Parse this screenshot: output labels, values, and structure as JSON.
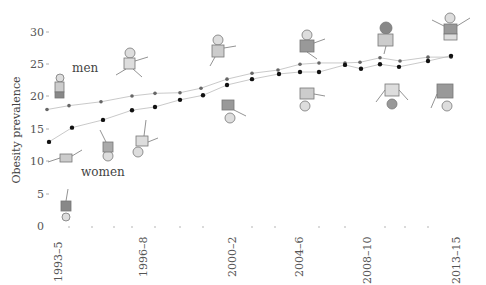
{
  "chart_data": {
    "type": "line",
    "title": "",
    "xlabel": "",
    "ylabel": "Obesity prevalence",
    "ylim": [
      0,
      30
    ],
    "yticks": [
      0,
      5,
      10,
      15,
      20,
      25,
      30
    ],
    "xtick_labels": [
      "1993–5",
      "1996–8",
      "2000–2",
      "2004–6",
      "2008–10",
      "2013–15"
    ],
    "grid": false,
    "legend": "inline labels",
    "series": [
      {
        "name": "men",
        "x_px": [
          47,
          69,
          101,
          132,
          155,
          180,
          201,
          227,
          252,
          278,
          300,
          319,
          345,
          360,
          380,
          400,
          428,
          451
        ],
        "values": [
          18.0,
          18.6,
          19.2,
          20.1,
          20.5,
          20.6,
          21.3,
          22.7,
          23.6,
          24.1,
          25.0,
          25.2,
          25.2,
          25.3,
          26.0,
          25.5,
          26.1,
          26.1
        ]
      },
      {
        "name": "women",
        "x_px": [
          49,
          72,
          103,
          132,
          155,
          180,
          203,
          227,
          252,
          279,
          300,
          319,
          345,
          361,
          380,
          399,
          428,
          451
        ],
        "values": [
          13.0,
          15.2,
          16.4,
          17.9,
          18.4,
          19.5,
          20.2,
          21.8,
          22.7,
          23.5,
          23.8,
          23.8,
          24.9,
          24.3,
          25.0,
          24.6,
          25.5,
          26.3
        ]
      }
    ],
    "annotations": [
      "men",
      "women"
    ],
    "decorations": "cartoon figures of men (upright, above line) and women (upside-down, below line) at intervals"
  },
  "labels": {
    "ylabel": "Obesity prevalence",
    "men": "men",
    "women": "women",
    "yticks": [
      "30",
      "25",
      "20",
      "15",
      "10",
      "5",
      "0"
    ],
    "xticks": [
      "1993–5",
      "1996–8",
      "2000–2",
      "2004–6",
      "2008–10",
      "2013–15"
    ]
  }
}
